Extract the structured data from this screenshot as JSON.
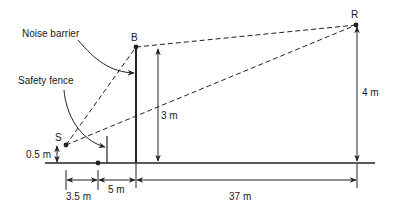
{
  "diagram": {
    "colors": {
      "ink": "#222222",
      "background": "#ffffff"
    },
    "points": {
      "S": {
        "label": "S",
        "x": 66,
        "y": 145
      },
      "B": {
        "label": "B",
        "x": 136,
        "y": 47
      },
      "R": {
        "label": "R",
        "x": 356,
        "y": 25
      },
      "fence_base": {
        "x": 98,
        "y": 163
      }
    },
    "ground": {
      "x1": 45,
      "x2": 375,
      "y": 163
    },
    "fence": {
      "x": 107,
      "top": 136,
      "bottom": 163
    },
    "barrier": {
      "x": 136,
      "top": 47,
      "bottom": 163
    },
    "callouts": {
      "noise_barrier": {
        "text": "Noise barrier",
        "x": 32,
        "y": 37
      },
      "safety_fence": {
        "text": "Safety fence",
        "x": 18,
        "y": 83
      }
    },
    "heights": {
      "source": {
        "text": "0.5 m",
        "value": 0.5
      },
      "barrier": {
        "text": "3 m",
        "value": 3
      },
      "receiver": {
        "text": "4 m",
        "value": 4
      }
    },
    "distances": [
      {
        "text": "3.5 m",
        "value": 3.5,
        "from_x": 66,
        "to_x": 98
      },
      {
        "text": "5 m",
        "value": 5,
        "from_x": 98,
        "to_x": 136
      },
      {
        "text": "37 m",
        "value": 37,
        "from_x": 136,
        "to_x": 357
      }
    ]
  }
}
